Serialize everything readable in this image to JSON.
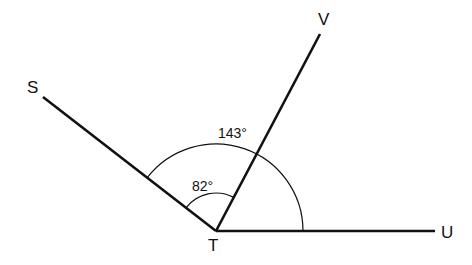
{
  "diagram": {
    "type": "angle-figure",
    "vertex": {
      "label": "T",
      "x": 216,
      "y": 231
    },
    "rays": [
      {
        "name": "TS",
        "end_label": "S",
        "x2": 43,
        "y2": 97
      },
      {
        "name": "TV",
        "end_label": "V",
        "x2": 320,
        "y2": 34
      },
      {
        "name": "TU",
        "end_label": "U",
        "x2": 435,
        "y2": 231
      }
    ],
    "angles": [
      {
        "name": "STV",
        "label": "82°",
        "radius": 38
      },
      {
        "name": "STU",
        "label": "143°",
        "radius": 87
      }
    ],
    "labels": {
      "S": "S",
      "V": "V",
      "U": "U",
      "T": "T",
      "angle_small": "82°",
      "angle_large": "143°"
    },
    "colors": {
      "line": "#111111",
      "background": "#ffffff"
    }
  }
}
